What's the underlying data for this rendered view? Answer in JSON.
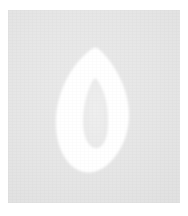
{
  "image": {
    "kind": "scanned-glyph-swatch",
    "width": 188,
    "height": 216,
    "alt_text": "Scanned light gray paper swatch with a white stylized zero glyph"
  },
  "canvas": {
    "page_background_color": "#FFFFFF"
  },
  "plate": {
    "label": "paper-swatch",
    "background_color": "#E6E6E6",
    "left": 8,
    "top": 10,
    "width": 172,
    "height": 193,
    "texture": "paper-grain"
  },
  "glyph": {
    "name": "digit-zero",
    "character": "0",
    "description": "pointed-top rounded-bottom leaf outline",
    "fill_color": "#FFFFFF",
    "outer": {
      "top_tip_x": 97,
      "top_tip_y": 48,
      "bottom_y": 177,
      "left_x": 63,
      "right_x": 128,
      "widest_y": 112
    },
    "counter": {
      "name": "glyph-counter",
      "fill_color": "#EDEDED",
      "top_tip_x": 95,
      "top_tip_y": 78,
      "bottom_y": 148,
      "left_x": 85,
      "right_x": 110,
      "widest_y": 113
    }
  }
}
